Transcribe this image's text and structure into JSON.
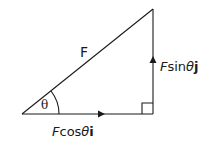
{
  "diagram": {
    "hypotenuse_label": "F",
    "angle_label": "θ",
    "horizontal_label": {
      "prefix": "F",
      "func": "cos",
      "angle": "θ",
      "unit": "i"
    },
    "vertical_label": {
      "prefix": "F",
      "func": "sin",
      "angle": "θ",
      "unit": "j"
    },
    "colors": {
      "stroke": "#1a1a1a",
      "background": "#ffffff"
    }
  }
}
